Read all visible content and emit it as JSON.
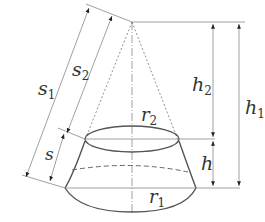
{
  "diagram": {
    "labels": {
      "s1": {
        "main": "s",
        "sub": "1"
      },
      "s2": {
        "main": "s",
        "sub": "2"
      },
      "s": {
        "main": "s",
        "sub": ""
      },
      "h1": {
        "main": "h",
        "sub": "1"
      },
      "h2": {
        "main": "h",
        "sub": "2"
      },
      "h": {
        "main": "h",
        "sub": ""
      },
      "r1": {
        "main": "r",
        "sub": "1"
      },
      "r2": {
        "main": "r",
        "sub": "2"
      }
    },
    "colors": {
      "outline": "#555555",
      "dimension": "#888888",
      "text": "#333333",
      "background": "#ffffff"
    }
  }
}
